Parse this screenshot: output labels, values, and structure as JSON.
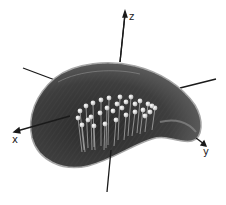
{
  "figure": {
    "type": "3d-surface-render",
    "axes": {
      "x_label": "x",
      "y_label": "y",
      "z_label": "z"
    },
    "colors": {
      "surface": "#3a3a3a",
      "surface_edge": "#9a9a9a",
      "markers": "#e8e8e8",
      "axes": "#1a1a1a",
      "background": "#ffffff"
    },
    "marker_count": 30
  }
}
